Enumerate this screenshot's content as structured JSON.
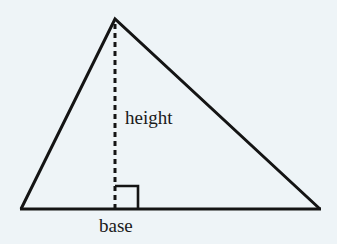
{
  "figure": {
    "type": "geometry-diagram",
    "background_color": "#eef4f7",
    "stroke_color": "#141414"
  },
  "labels": {
    "height": "height",
    "base": "base"
  },
  "geometry": {
    "apex": {
      "x": 115,
      "y": 19
    },
    "base_left": {
      "x": 21,
      "y": 209
    },
    "base_right": {
      "x": 320,
      "y": 209
    },
    "altitude_foot": {
      "x": 115,
      "y": 209
    },
    "right_angle_marker": {
      "x": 115,
      "y": 186,
      "size": 23
    },
    "stroke_width": 3,
    "dash_pattern": "5 4",
    "dash_width": 3
  },
  "icons": {
    "right_angle": "right-angle-icon",
    "altitude": "dashed-altitude-icon"
  }
}
